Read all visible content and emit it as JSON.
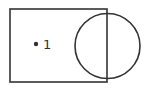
{
  "diagram": {
    "type": "venn",
    "shapes": [
      {
        "kind": "rectangle",
        "name": "universal-set"
      },
      {
        "kind": "circle",
        "name": "set-circle"
      }
    ],
    "points": [
      {
        "label": "1",
        "region": "rectangle-only"
      }
    ],
    "stroke_color": "#333333"
  }
}
